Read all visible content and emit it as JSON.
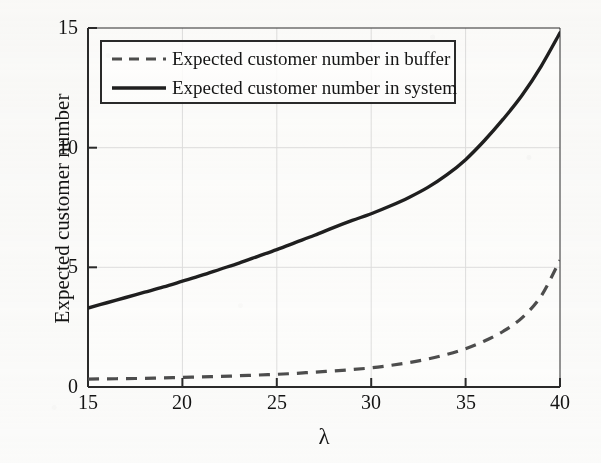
{
  "figure": {
    "background_color": "#fbfbfa",
    "ink_color": "#1f1f1f",
    "grid_color": "#d8d8d6"
  },
  "axes": {
    "xlabel": "λ",
    "ylabel": "Expected customer number",
    "xticks": [
      "15",
      "20",
      "25",
      "30",
      "35",
      "40"
    ],
    "yticks": [
      "0",
      "5",
      "10",
      "15"
    ]
  },
  "legend": {
    "entries": [
      {
        "label": "Expected customer number in buffer",
        "style": "dashed",
        "color": "#4d4d4d"
      },
      {
        "label": "Expected customer number in system",
        "style": "solid",
        "color": "#1f1f1f"
      }
    ]
  },
  "chart_data": {
    "type": "line",
    "title": "",
    "xlabel": "λ",
    "ylabel": "Expected customer number",
    "xlim": [
      15,
      40
    ],
    "ylim": [
      0,
      15
    ],
    "xticks": [
      15,
      20,
      25,
      30,
      35,
      40
    ],
    "yticks": [
      0,
      5,
      10,
      15
    ],
    "grid": true,
    "legend_position": "upper left",
    "x": [
      15,
      16,
      17,
      18,
      19,
      20,
      21,
      22,
      23,
      24,
      25,
      26,
      27,
      28,
      29,
      30,
      31,
      32,
      33,
      34,
      35,
      36,
      37,
      38,
      39,
      40
    ],
    "series": [
      {
        "name": "Expected customer number in buffer",
        "style": "dashed",
        "color": "#4d4d4d",
        "values": [
          0.33,
          0.34,
          0.35,
          0.36,
          0.38,
          0.4,
          0.42,
          0.44,
          0.47,
          0.5,
          0.53,
          0.57,
          0.62,
          0.67,
          0.73,
          0.8,
          0.9,
          1.02,
          1.17,
          1.36,
          1.6,
          1.92,
          2.33,
          2.9,
          3.8,
          5.3
        ]
      },
      {
        "name": "Expected customer number in system",
        "style": "solid",
        "color": "#1f1f1f",
        "values": [
          3.3,
          3.52,
          3.74,
          3.96,
          4.18,
          4.42,
          4.66,
          4.92,
          5.18,
          5.46,
          5.74,
          6.04,
          6.34,
          6.66,
          6.96,
          7.24,
          7.56,
          7.92,
          8.34,
          8.86,
          9.5,
          10.3,
          11.2,
          12.2,
          13.4,
          14.8
        ]
      }
    ]
  }
}
